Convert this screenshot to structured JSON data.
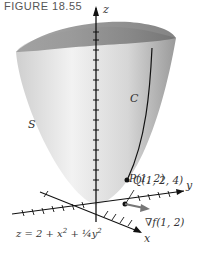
{
  "figure": {
    "title": "FIGURE 18.55"
  },
  "labels": {
    "z_axis": "z",
    "y_axis": "y",
    "x_axis": "x",
    "surface": "S",
    "curve": "C",
    "point_q": "Q(1, 2, 4)",
    "point_p": "P(1, 2)",
    "gradient": "∇f(1, 2)",
    "equation_prefix": "z = 2 + x",
    "equation_sup1": "2",
    "equation_mid": " + ",
    "equation_frac": "¼",
    "equation_y": "y",
    "equation_sup2": "2"
  }
}
